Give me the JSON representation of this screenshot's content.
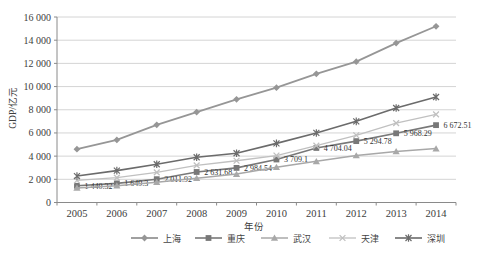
{
  "page": {
    "background": "#ffffff"
  },
  "chart_data": {
    "type": "line",
    "title": "",
    "xlabel": "年份",
    "ylabel": "GDP/亿元",
    "ylim": [
      0,
      16000
    ],
    "y_step": 2000,
    "y_tick_labels": [
      "0",
      "2 000",
      "4 000",
      "6 000",
      "8 000",
      "10 000",
      "12 000",
      "14 000",
      "16 000"
    ],
    "categories": [
      "2005",
      "2006",
      "2007",
      "2008",
      "2009",
      "2010",
      "2011",
      "2012",
      "2013",
      "2014"
    ],
    "grid": true,
    "legend_position": "bottom",
    "colors": {
      "grid": "#c9c9c9",
      "axis": "#8a8a8a",
      "text": "#3d3d3d"
    },
    "series": [
      {
        "id": "shanghai",
        "name": "上海",
        "marker": "diamond",
        "color": "#969696",
        "width": 1.8,
        "values": [
          4600,
          5400,
          6700,
          7800,
          8900,
          9900,
          11100,
          12150,
          13750,
          15200
        ]
      },
      {
        "id": "chongqing",
        "name": "重庆",
        "marker": "square",
        "color": "#787878",
        "width": 1.6,
        "values": [
          1440.32,
          1649.3,
          2011.92,
          2631.68,
          2984.54,
          3709.1,
          4704.04,
          5294.78,
          5968.29,
          6672.51
        ],
        "point_labels": [
          "1 440.32",
          "1 649.3",
          "2 011.92",
          "2 631.68",
          "2 984.54",
          "3 709.1",
          "4 704.04",
          "5 294.78",
          "5 968.29",
          "6 672.51"
        ]
      },
      {
        "id": "wuhan",
        "name": "武汉",
        "marker": "triangle",
        "color": "#a8a8a8",
        "width": 1.5,
        "values": [
          1250,
          1450,
          1750,
          2100,
          2450,
          3050,
          3550,
          4050,
          4400,
          4650
        ]
      },
      {
        "id": "tianjin",
        "name": "天津",
        "marker": "x",
        "color": "#c0c0c0",
        "width": 1.3,
        "values": [
          1900,
          2150,
          2600,
          3200,
          3600,
          4050,
          4900,
          5800,
          6850,
          7600
        ]
      },
      {
        "id": "shenzhen",
        "name": "深圳",
        "marker": "asterisk",
        "color": "#6b6b6b",
        "width": 1.6,
        "values": [
          2280,
          2750,
          3300,
          3900,
          4250,
          5100,
          6000,
          7000,
          8150,
          9100
        ]
      }
    ]
  }
}
